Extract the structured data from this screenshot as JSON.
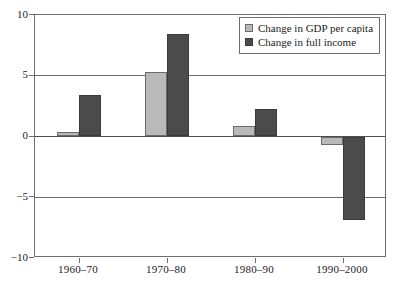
{
  "figure": {
    "cut_off_caption_sliver": "",
    "background_color": "#ffffff",
    "axis_color": "#6d6d6d"
  },
  "legend": {
    "position": "top-right",
    "entries": [
      {
        "label": "Change in GDP per capita",
        "color": "#b9b9b9",
        "swatch": "light-gray-square-icon"
      },
      {
        "label": "Change in full income",
        "color": "#4b4b4b",
        "swatch": "dark-gray-square-icon"
      }
    ]
  },
  "chart_data": {
    "type": "bar",
    "title": "",
    "xlabel": "",
    "ylabel": "",
    "ylim": [
      -10,
      10
    ],
    "yticks": [
      10,
      5,
      0,
      -5,
      -10
    ],
    "ytick_labels": [
      "10",
      "5",
      "0",
      "−5",
      "−10"
    ],
    "grid": true,
    "gridlines_at": [
      10,
      5,
      0,
      -5,
      -10
    ],
    "legend_position": "top-right",
    "categories": [
      "1960–70",
      "1970–80",
      "1980–90",
      "1990–2000"
    ],
    "series": [
      {
        "name": "Change in GDP per capita",
        "color": "#b9b9b9",
        "values": [
          0.35,
          5.3,
          0.85,
          -0.7
        ]
      },
      {
        "name": "Change in full income",
        "color": "#4b4b4b",
        "values": [
          3.4,
          8.4,
          2.25,
          -6.9
        ]
      }
    ]
  }
}
